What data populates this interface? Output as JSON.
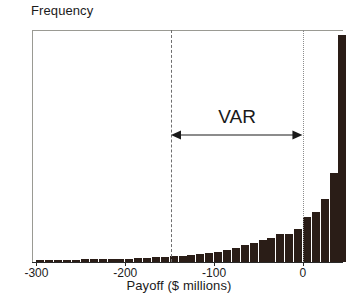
{
  "chart_data": {
    "type": "bar",
    "title": "",
    "xlabel": "Payoff ($ millions)",
    "ylabel": "Frequency",
    "xlim": [
      -305,
      44
    ],
    "ylim": [
      0,
      100
    ],
    "grid": false,
    "legend": null,
    "bin_width": 10,
    "x": [
      -300,
      -290,
      -280,
      -270,
      -260,
      -250,
      -240,
      -230,
      -220,
      -210,
      -200,
      -190,
      -180,
      -170,
      -160,
      -150,
      -140,
      -130,
      -120,
      -110,
      -100,
      -90,
      -80,
      -70,
      -60,
      -50,
      -40,
      -30,
      -20,
      -10,
      0,
      10,
      20,
      30,
      40
    ],
    "values": [
      1.0,
      1.0,
      1.0,
      1.0,
      1.0,
      1.2,
      1.2,
      1.2,
      1.3,
      1.4,
      1.5,
      1.6,
      1.8,
      2.0,
      2.2,
      2.4,
      2.6,
      3.0,
      3.4,
      3.8,
      4.4,
      5.2,
      6.0,
      7.2,
      8.0,
      9.6,
      10.4,
      12.0,
      12.2,
      14.4,
      19.2,
      21.6,
      27.2,
      38.4,
      98.0
    ],
    "annotations": [
      {
        "name": "var-span",
        "label": "VAR",
        "x_start": -148,
        "x_end": 0,
        "style": "double-headed-arrow"
      }
    ],
    "reference_lines": [
      {
        "name": "var-lower-bound",
        "x": -148,
        "style": "dashed"
      },
      {
        "name": "var-upper-bound",
        "x": 0,
        "style": "dotted"
      }
    ],
    "xticks": [
      -300,
      -200,
      -100,
      0
    ],
    "xticklabels": [
      "-300",
      "-200",
      "-100",
      "0"
    ],
    "yticks": [],
    "yticklabels": [],
    "bar_color": "#2a1d17",
    "axis_color": "#2a2a2a",
    "frame_color": "#9a9a93"
  }
}
